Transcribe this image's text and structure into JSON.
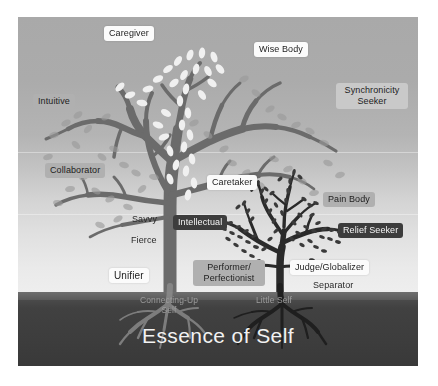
{
  "diagram": {
    "title": "Essence of Self",
    "ground_labels": {
      "connecting_up_self": "Connecting-Up\nSelf",
      "connecting_up_self_line1": "Connecting-Up",
      "connecting_up_self_line2": "Self",
      "little_self": "Little Self"
    },
    "big_tree_labels": [
      {
        "text": "Caregiver",
        "style": "white"
      },
      {
        "text": "Wise Body",
        "style": "white"
      },
      {
        "text": "Intuitive",
        "style": "gray"
      },
      {
        "text": "Synchronicity Seeker",
        "style": "lightgray"
      },
      {
        "text": "Collaborator",
        "style": "gray"
      },
      {
        "text": "Savvy",
        "style": "plain"
      },
      {
        "text": "Fierce",
        "style": "plain"
      },
      {
        "text": "Unifier",
        "style": "white"
      }
    ],
    "small_tree_labels": [
      {
        "text": "Caretaker",
        "style": "white"
      },
      {
        "text": "Pain Body",
        "style": "gray"
      },
      {
        "text": "Intellectual",
        "style": "dark"
      },
      {
        "text": "Relief Seeker",
        "style": "dark"
      },
      {
        "text": "Performer/ Perfectionist",
        "style": "gray"
      },
      {
        "text": "Judge/Globalizer",
        "style": "white"
      },
      {
        "text": "Separator",
        "style": "plain"
      }
    ],
    "label_text": {
      "caregiver": "Caregiver",
      "wise_body": "Wise Body",
      "intuitive": "Intuitive",
      "synchronicity_line1": "Synchronicity",
      "synchronicity_line2": "Seeker",
      "collaborator": "Collaborator",
      "savvy": "Savvy",
      "fierce": "Fierce",
      "unifier": "Unifier",
      "caretaker": "Caretaker",
      "pain_body": "Pain Body",
      "intellectual": "Intellectual",
      "relief_seeker": "Relief Seeker",
      "performer_line1": "Performer/",
      "performer_line2": "Perfectionist",
      "judge_globalizer": "Judge/Globalizer",
      "separator": "Separator"
    },
    "colors": {
      "big_tree": "#6b6b6b",
      "big_tree_leaf_light": "#f0f0f0",
      "big_tree_leaf_muted": "#9a9a9a",
      "small_tree": "#2a2a2a",
      "small_tree_leaf": "#3a3a3a",
      "soil": "#3d3d3d",
      "root": "#8d8d8d",
      "background_top": "#a9a9a9",
      "background_bottom": "#f2f2f2"
    }
  }
}
